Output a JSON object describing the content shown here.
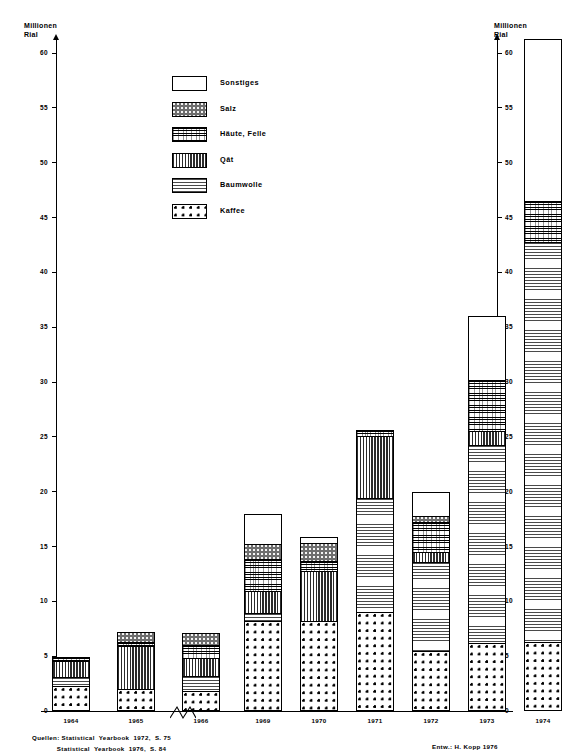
{
  "axis": {
    "y_title": "Millionen\nRial",
    "y_ticks": [
      "0",
      "5",
      "10",
      "15",
      "20",
      "25",
      "30",
      "35",
      "40",
      "45",
      "50",
      "55",
      "60"
    ],
    "y_min": 0,
    "y_max": 60
  },
  "legend": {
    "items": [
      {
        "label": "Sonstiges",
        "pattern": "p-sonstiges",
        "icon": "swatch-empty-icon"
      },
      {
        "label": "Salz",
        "pattern": "p-salz",
        "icon": "swatch-dark-stipple-icon"
      },
      {
        "label": "Häute, Felle",
        "pattern": "p-haeute",
        "icon": "swatch-crosshatch-icon"
      },
      {
        "label": "Qāt",
        "pattern": "p-qat",
        "icon": "swatch-vertical-lines-icon"
      },
      {
        "label": "Baumwolle",
        "pattern": "p-baumwolle",
        "icon": "swatch-dashed-lines-icon"
      },
      {
        "label": "Kaffee",
        "pattern": "p-kaffee",
        "icon": "swatch-dots-icon"
      }
    ]
  },
  "footer": {
    "sources": "Quellen: Statistical  Yearbook  1972,  S. 75\n            Statistical  Yearbook  1976,  S. 84",
    "author": "Entw.: H. Kopp 1976"
  },
  "chart_data": {
    "type": "bar",
    "subtype": "stacked-bar",
    "title": "",
    "xlabel": "",
    "ylabel": "Millionen Rial",
    "ylim": [
      0,
      60
    ],
    "grid": false,
    "legend_position": "inside-top-left",
    "axis_break_after_category": "1966",
    "categories": [
      "1964",
      "1965",
      "1966",
      "1969",
      "1970",
      "1971",
      "1972",
      "1973",
      "1974"
    ],
    "series": [
      {
        "name": "Kaffee",
        "values": [
          2.3,
          2.0,
          1.8,
          8.2,
          8.2,
          9.0,
          5.5,
          6.2,
          6.3
        ]
      },
      {
        "name": "Baumwolle",
        "values": [
          0.8,
          0.0,
          1.4,
          0.7,
          0.0,
          10.4,
          8.1,
          18.1,
          36.5
        ]
      },
      {
        "name": "Qāt",
        "values": [
          1.5,
          3.9,
          1.6,
          2.0,
          4.6,
          5.7,
          0.9,
          1.2,
          0.0
        ]
      },
      {
        "name": "Häute, Felle",
        "values": [
          0.3,
          0.4,
          1.2,
          3.0,
          0.9,
          0.5,
          2.7,
          4.7,
          3.7
        ]
      },
      {
        "name": "Salz",
        "values": [
          0.0,
          0.9,
          1.1,
          1.3,
          1.6,
          0.0,
          0.6,
          0.0,
          0.0
        ]
      },
      {
        "name": "Sonstiges",
        "values": [
          0.0,
          0.0,
          0.0,
          2.8,
          0.6,
          0.0,
          2.2,
          5.8,
          14.8
        ]
      }
    ],
    "totals": [
      4.9,
      7.2,
      7.1,
      18.0,
      15.9,
      25.6,
      20.0,
      36.0,
      61.3
    ]
  }
}
